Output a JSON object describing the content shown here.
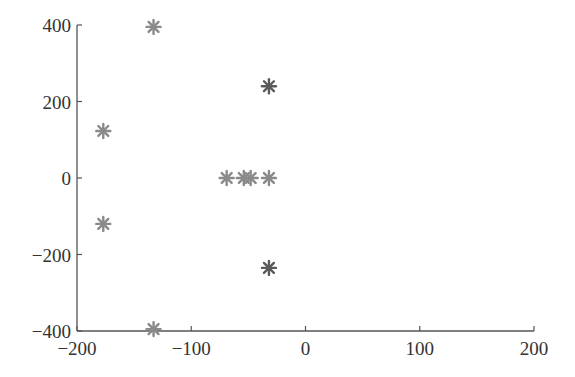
{
  "chart_data": {
    "type": "scatter",
    "title": "",
    "xlabel": "",
    "ylabel": "",
    "xlim": [
      -200,
      200
    ],
    "ylim": [
      -400,
      400
    ],
    "x_ticks": [
      -200,
      -100,
      0,
      100,
      200
    ],
    "y_ticks": [
      -400,
      -200,
      0,
      200,
      400
    ],
    "x_tick_labels": [
      "−200",
      "−100",
      "0",
      "100",
      "200"
    ],
    "y_tick_labels": [
      "−400",
      "−200",
      "0",
      "200",
      "400"
    ],
    "grid": false,
    "legend": null,
    "marker": "asterisk",
    "marker_color": "#8a8a8a",
    "marker_color_dark": "#5a5a5a",
    "series": [
      {
        "name": "points",
        "points": [
          {
            "x": -133,
            "y": 395
          },
          {
            "x": -133,
            "y": -395
          },
          {
            "x": -177,
            "y": 123
          },
          {
            "x": -177,
            "y": -120
          },
          {
            "x": -32,
            "y": 240,
            "emphasis": true
          },
          {
            "x": -32,
            "y": -235,
            "emphasis": true
          },
          {
            "x": -69,
            "y": 0
          },
          {
            "x": -54,
            "y": 0
          },
          {
            "x": -48,
            "y": 0
          },
          {
            "x": -32,
            "y": 0
          }
        ]
      }
    ]
  }
}
